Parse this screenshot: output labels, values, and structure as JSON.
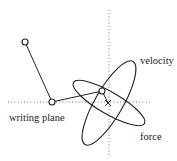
{
  "diagram": {
    "labels": {
      "velocity": "velocity",
      "force": "force",
      "writing_plane": "writing plane"
    },
    "nodes": [
      {
        "id": "shoulder",
        "x": 25,
        "y": 42
      },
      {
        "id": "elbow",
        "x": 52,
        "y": 102
      },
      {
        "id": "wrist",
        "x": 102,
        "y": 91
      }
    ],
    "target": {
      "symbol": "×",
      "x": 108,
      "y": 103
    },
    "axes": {
      "horizontal": {
        "y": 102,
        "x1": 8,
        "x2": 150
      },
      "vertical": {
        "x": 109,
        "y1": 10,
        "y2": 155
      }
    },
    "ellipses": [
      {
        "name": "velocity",
        "cx": 109,
        "cy": 103,
        "rx": 48,
        "ry": 14,
        "rotation": -60
      },
      {
        "name": "force",
        "cx": 109,
        "cy": 103,
        "rx": 41,
        "ry": 11,
        "rotation": 30
      }
    ],
    "colors": {
      "stroke": "#222222",
      "dotted": "#777777",
      "background": "#ffffff"
    }
  }
}
